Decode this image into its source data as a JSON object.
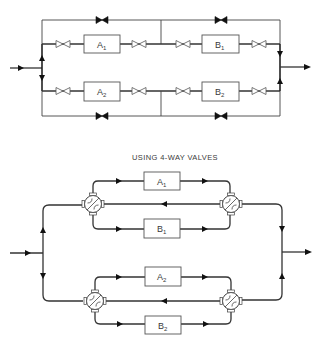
{
  "diagram": {
    "top": {
      "name": "Conventional valve arrangement",
      "units": [
        {
          "id": "A1",
          "letter": "A",
          "sub": "1"
        },
        {
          "id": "B1",
          "letter": "B",
          "sub": "1"
        },
        {
          "id": "A2",
          "letter": "A",
          "sub": "2"
        },
        {
          "id": "B2",
          "letter": "B",
          "sub": "2"
        }
      ],
      "valves": {
        "open_gate_valves": 8,
        "closed_bypass_valves": 4
      }
    },
    "bottom": {
      "title": "USING 4-WAY VALVES",
      "units": [
        {
          "id": "A1",
          "letter": "A",
          "sub": "1"
        },
        {
          "id": "B1",
          "letter": "B",
          "sub": "1"
        },
        {
          "id": "A2",
          "letter": "A",
          "sub": "2"
        },
        {
          "id": "B2",
          "letter": "B",
          "sub": "2"
        }
      ],
      "valves": {
        "four_way_valves": 4
      }
    }
  },
  "colors": {
    "line": "#333333",
    "background": "#ffffff"
  }
}
